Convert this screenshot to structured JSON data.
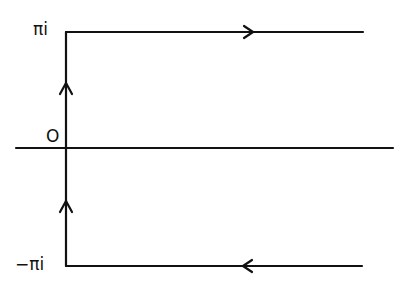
{
  "diagram": {
    "labels": {
      "top": "πi",
      "origin": "O",
      "bottom": "−πi"
    },
    "stroke_color": "#111111",
    "background": "#ffffff",
    "elements": [
      {
        "type": "axis",
        "name": "real-axis",
        "from": [
          16,
          148
        ],
        "to": [
          393,
          148
        ]
      },
      {
        "type": "segment",
        "name": "imaginary-segment",
        "from": [
          66,
          266
        ],
        "to": [
          66,
          32
        ],
        "arrows": [
          "up",
          "up"
        ]
      },
      {
        "type": "segment",
        "name": "top-ray",
        "from": [
          66,
          32
        ],
        "to": [
          363,
          32
        ],
        "arrow": "right"
      },
      {
        "type": "segment",
        "name": "bottom-ray",
        "from": [
          362,
          266
        ],
        "to": [
          66,
          266
        ],
        "arrow": "left"
      }
    ]
  }
}
